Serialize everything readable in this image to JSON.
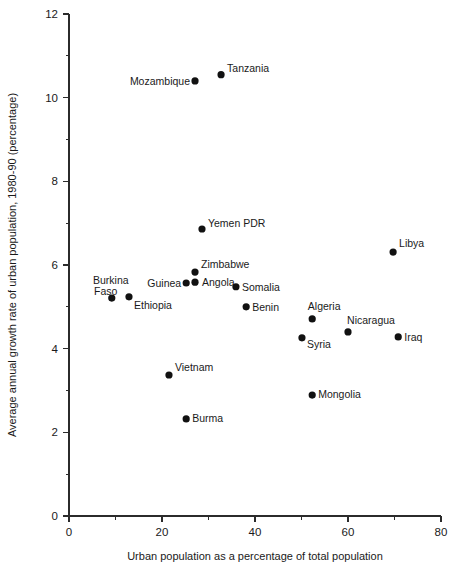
{
  "chart_data": {
    "type": "scatter",
    "title": "",
    "xlabel": "Urban population as a percentage of total population",
    "ylabel": "Average annual growth rate of urban population, 1980-90 (percentage)",
    "xlim": [
      0,
      80
    ],
    "ylim": [
      0,
      12
    ],
    "xticks": [
      "0",
      "20",
      "40",
      "60",
      "80"
    ],
    "xtick_values": [
      0,
      20,
      40,
      60,
      80
    ],
    "xminor_values": [
      10,
      30,
      50,
      70
    ],
    "yticks": [
      "0",
      "2",
      "4",
      "6",
      "8",
      "10",
      "12"
    ],
    "ytick_values": [
      0,
      2,
      4,
      6,
      8,
      10,
      12
    ],
    "yminor_values": [
      1,
      3,
      5,
      7,
      9,
      11
    ],
    "grid": false,
    "legend": "none",
    "point_color": "#111111",
    "points": [
      {
        "label": "Mozambique",
        "x": 27.1,
        "y": 10.4,
        "anchor": "end",
        "dx": -5,
        "dy": 4
      },
      {
        "label": "Tanzania",
        "x": 32.7,
        "y": 10.55,
        "anchor": "start",
        "dx": 6,
        "dy": -3
      },
      {
        "label": "Yemen PDR",
        "x": 28.6,
        "y": 6.86,
        "anchor": "start",
        "dx": 6,
        "dy": -2
      },
      {
        "label": "Libya",
        "x": 69.7,
        "y": 6.31,
        "anchor": "start",
        "dx": 6,
        "dy": -5
      },
      {
        "label": "Zimbabwe",
        "x": 27.1,
        "y": 5.83,
        "anchor": "start",
        "dx": 6,
        "dy": -4
      },
      {
        "label": "Angola",
        "x": 27.1,
        "y": 5.59,
        "anchor": "start",
        "dx": 7,
        "dy": 4
      },
      {
        "label": "Guinea",
        "x": 25.2,
        "y": 5.57,
        "anchor": "end",
        "dx": -5,
        "dy": 4
      },
      {
        "label": "Somalia",
        "x": 35.9,
        "y": 5.48,
        "anchor": "start",
        "dx": 6,
        "dy": 4
      },
      {
        "label": "Benin",
        "x": 38.1,
        "y": 5.0,
        "anchor": "start",
        "dx": 6,
        "dy": 4
      },
      {
        "label": "Burkina",
        "x": 9.2,
        "y": 5.21,
        "anchor": "middle",
        "dx": -1,
        "dy": -14
      },
      {
        "label": "Faso",
        "x": 9.2,
        "y": 5.21,
        "anchor": "middle",
        "dx": -6,
        "dy": -3,
        "nodot": true
      },
      {
        "label": "Ethiopia",
        "x": 12.9,
        "y": 5.24,
        "anchor": "start",
        "dx": 5,
        "dy": 12
      },
      {
        "label": "Algeria",
        "x": 52.3,
        "y": 4.71,
        "anchor": "middle",
        "dx": 12,
        "dy": -9
      },
      {
        "label": "Nicaragua",
        "x": 60.0,
        "y": 4.4,
        "anchor": "middle",
        "dx": 23,
        "dy": -8
      },
      {
        "label": "Iraq",
        "x": 70.8,
        "y": 4.28,
        "anchor": "start",
        "dx": 6,
        "dy": 4
      },
      {
        "label": "Syria",
        "x": 50.1,
        "y": 4.26,
        "anchor": "start",
        "dx": 5,
        "dy": 10
      },
      {
        "label": "Vietnam",
        "x": 21.5,
        "y": 3.37,
        "anchor": "start",
        "dx": 6,
        "dy": -4
      },
      {
        "label": "Mongolia",
        "x": 52.3,
        "y": 2.89,
        "anchor": "start",
        "dx": 6,
        "dy": 3
      },
      {
        "label": "Burma",
        "x": 25.2,
        "y": 2.32,
        "anchor": "start",
        "dx": 6,
        "dy": 3
      }
    ]
  }
}
